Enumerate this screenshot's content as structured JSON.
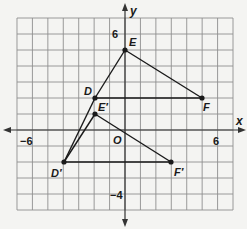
{
  "chart_data": {
    "type": "scatter",
    "title": "",
    "xlabel": "x",
    "ylabel": "y",
    "xlim": [
      -7,
      7
    ],
    "ylim": [
      -5,
      7
    ],
    "grid": true,
    "tick_labels": {
      "x": [
        {
          "value": -6,
          "label": "−6"
        },
        {
          "value": 6,
          "label": "6"
        }
      ],
      "y": [
        {
          "value": 6,
          "label": "6"
        },
        {
          "value": -4,
          "label": "−4"
        }
      ]
    },
    "origin_label": "O",
    "series": [
      {
        "name": "Triangle DEF",
        "points": [
          {
            "label": "D",
            "x": -2,
            "y": 2
          },
          {
            "label": "E",
            "x": 0,
            "y": 5
          },
          {
            "label": "F",
            "x": 5,
            "y": 2
          }
        ]
      },
      {
        "name": "Triangle D'E'F'",
        "points": [
          {
            "label": "D′",
            "x": -4,
            "y": -2
          },
          {
            "label": "E′",
            "x": -2,
            "y": 1
          },
          {
            "label": "F′",
            "x": 3,
            "y": -2
          }
        ]
      }
    ],
    "segments": [
      {
        "from": "D",
        "to": "E"
      },
      {
        "from": "E",
        "to": "F"
      },
      {
        "from": "D",
        "to": "F"
      },
      {
        "from": "D′",
        "to": "E′"
      },
      {
        "from": "E′",
        "to": "F′"
      },
      {
        "from": "D′",
        "to": "F′"
      },
      {
        "from": "D′",
        "to": "D"
      }
    ]
  },
  "labels": {
    "x_axis": "x",
    "y_axis": "y",
    "origin": "O",
    "x_neg6": "−6",
    "x_pos6": "6",
    "y_pos6": "6",
    "y_neg4": "−4",
    "D": "D",
    "E": "E",
    "F": "F",
    "Dp": "D′",
    "Ep": "E′",
    "Fp": "F′"
  },
  "colors": {
    "grid": "#8a8a8a",
    "axis": "#333333",
    "line": "#1a1a1a"
  }
}
